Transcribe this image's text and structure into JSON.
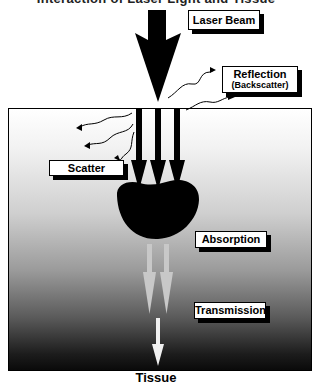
{
  "title": "Interaction of Laser Light and Tissue",
  "labels": {
    "laser_beam": "Laser Beam",
    "reflection": "Reflection",
    "reflection_sub": "(Backscatter)",
    "scatter": "Scatter",
    "absorption": "Absorption",
    "transmission": "Transmission"
  },
  "caption": "Tissue",
  "colors": {
    "arrow": "#000000",
    "transmission_arrow": "#c8c8c8",
    "final_arrow": "#f0f0f0"
  }
}
